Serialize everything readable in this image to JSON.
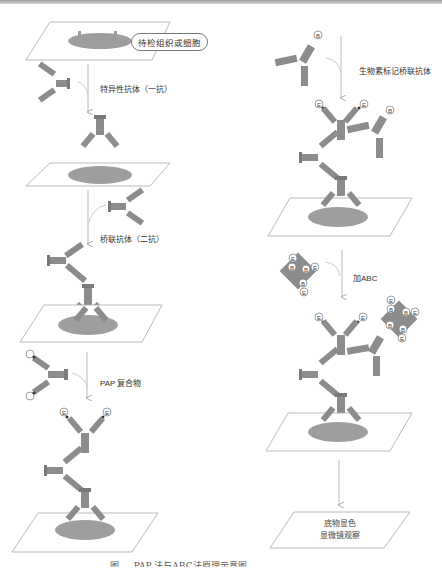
{
  "diagram": {
    "title_box": "待检组织或细胞",
    "left_steps": [
      {
        "label": "特异性抗体（一抗）"
      },
      {
        "label": "桥联抗体（二抗）"
      },
      {
        "label": "PAP 复合物"
      }
    ],
    "right_steps": [
      {
        "label": "生物素标记桥联抗体"
      },
      {
        "label": "加ABC"
      }
    ],
    "final_box": {
      "line1": "底物显色",
      "line2": "显微镜观察"
    },
    "markers": {
      "biotin": "B",
      "enzyme": "E"
    },
    "caption": "图 … PAP 法与ABC法原理示意图",
    "colors": {
      "antibody": "#8c8c8c",
      "tissue": "#9e9e9e",
      "arrow": "#b5b5b5",
      "slide_border": "#aaaaaa"
    }
  }
}
